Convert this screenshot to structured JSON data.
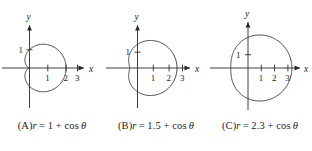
{
  "figure": {
    "background_color": "#ffffff",
    "stroke_color": "#3a3a3a",
    "axis_color": "#2a2a2a",
    "text_color": "#1b1b1b"
  },
  "panels": [
    {
      "id": "panel-a",
      "caption_label": "(A)",
      "caption_var": "r",
      "caption_eq": "= 1 + cos",
      "caption_theta": "θ",
      "caption_full": "(A) r = 1 + cos θ",
      "x_axis_label": "x",
      "y_axis_label": "y",
      "x_ticks": [
        "1",
        "2",
        "3"
      ],
      "y_ticks": [
        "1"
      ],
      "chart_data": {
        "type": "line",
        "curve": "limacon",
        "equation": "r = 1 + cos(theta)",
        "a": 1,
        "b": 1,
        "ratio_a_over_b": 1,
        "shape": "cardioid",
        "title": "(A) r = 1 + cos θ",
        "xlabel": "x",
        "ylabel": "y",
        "xlim": [
          -0.6,
          3.4
        ],
        "ylim": [
          -1.8,
          1.8
        ],
        "x_tick_values": [
          1,
          2,
          3
        ],
        "y_tick_values": [
          1
        ],
        "grid": false,
        "legend": "none",
        "max_r": 2,
        "r_at_theta_0": 2,
        "r_at_theta_pi_over_2": 1,
        "r_at_theta_pi": 0
      }
    },
    {
      "id": "panel-b",
      "caption_label": "(B)",
      "caption_var": "r",
      "caption_eq": "= 1.5 + cos",
      "caption_theta": "θ",
      "caption_full": "(B) r = 1.5 + cos θ",
      "x_axis_label": "x",
      "y_axis_label": "y",
      "x_ticks": [
        "1",
        "2",
        "3"
      ],
      "y_ticks": [
        "1"
      ],
      "chart_data": {
        "type": "line",
        "curve": "limacon",
        "equation": "r = 1.5 + cos(theta)",
        "a": 1.5,
        "b": 1,
        "ratio_a_over_b": 1.5,
        "shape": "dimpled limacon",
        "title": "(B) r = 1.5 + cos θ",
        "xlabel": "x",
        "ylabel": "y",
        "xlim": [
          -0.9,
          3.4
        ],
        "ylim": [
          -1.9,
          1.9
        ],
        "x_tick_values": [
          1,
          2,
          3
        ],
        "y_tick_values": [
          1
        ],
        "grid": false,
        "legend": "none",
        "max_r": 2.5,
        "r_at_theta_0": 2.5,
        "r_at_theta_pi_over_2": 1.5,
        "r_at_theta_pi": 0.5
      }
    },
    {
      "id": "panel-c",
      "caption_label": "(C)",
      "caption_var": "r",
      "caption_eq": "= 2.3 + cos",
      "caption_theta": "θ",
      "caption_full": "(C) r = 2.3 + cos θ",
      "x_axis_label": "x",
      "y_axis_label": "y",
      "x_ticks": [
        "1",
        "2",
        "3"
      ],
      "y_ticks": [
        "1"
      ],
      "chart_data": {
        "type": "line",
        "curve": "limacon",
        "equation": "r = 2.3 + cos(theta)",
        "a": 2.3,
        "b": 1,
        "ratio_a_over_b": 2.3,
        "shape": "convex limacon",
        "title": "(C) r = 2.3 + cos θ",
        "xlabel": "x",
        "ylabel": "y",
        "xlim": [
          -1.6,
          3.6
        ],
        "ylim": [
          -2.6,
          2.6
        ],
        "x_tick_values": [
          1,
          2,
          3
        ],
        "y_tick_values": [
          1
        ],
        "grid": false,
        "legend": "none",
        "max_r": 3.3,
        "r_at_theta_0": 3.3,
        "r_at_theta_pi_over_2": 2.3,
        "r_at_theta_pi": 1.3
      }
    }
  ]
}
